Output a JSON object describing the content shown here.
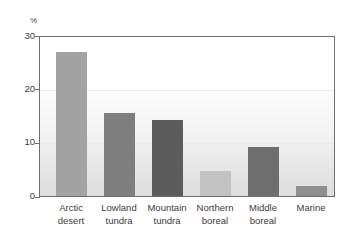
{
  "chart_data": {
    "type": "bar",
    "title": "",
    "subtitle": "",
    "xlabel": "",
    "ylabel": "%",
    "unit_label": "%",
    "categories": [
      "Arctic desert",
      "Lowland tundra",
      "Mountain tundra",
      "Northern boreal",
      "Middle boreal",
      "Marine"
    ],
    "category_lines": [
      [
        "Arctic",
        "desert"
      ],
      [
        "Lowland",
        "tundra"
      ],
      [
        "Mountain",
        "tundra"
      ],
      [
        "Northern",
        "boreal"
      ],
      [
        "Middle",
        "boreal"
      ],
      [
        "Marine",
        ""
      ]
    ],
    "values": [
      27.2,
      15.7,
      14.3,
      4.8,
      9.3,
      1.9
    ],
    "bar_colors": [
      "#a3a3a3",
      "#7e7e7e",
      "#5c5c5c",
      "#c2c2c2",
      "#6e6e6e",
      "#8f8f8f"
    ],
    "ylim": [
      0,
      30
    ],
    "yticks": [
      0,
      10,
      20,
      30
    ],
    "ytick_labels": [
      "0",
      "10",
      "20",
      "30"
    ],
    "grid": true,
    "gridlines_at": [
      10,
      20
    ],
    "legend": "none",
    "legend_position": "none"
  },
  "axis": {
    "y_unit": "%",
    "y_tick_0": "0",
    "y_tick_10": "10",
    "y_tick_20": "20",
    "y_tick_30": "30"
  },
  "colors": {
    "plot_border": "#6f6f6f",
    "gridline": "#e9e9e9",
    "text": "#3c3c3c",
    "plot_bg_top": "#ffffff",
    "plot_bg_bottom": "#dcdcdc"
  }
}
